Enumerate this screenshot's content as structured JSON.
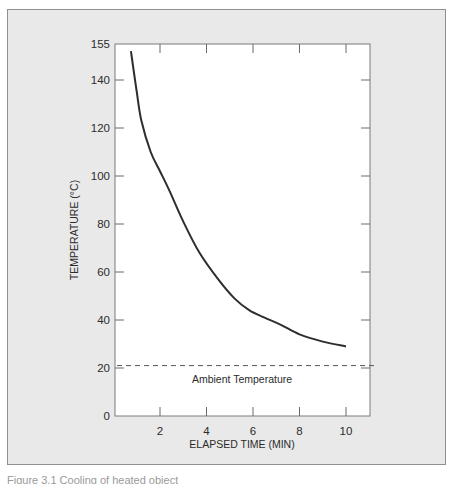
{
  "chart_data": {
    "type": "line",
    "title": "",
    "xlabel": "ELAPSED TIME (MIN)",
    "ylabel": "TEMPERATURE (°C)",
    "xlim": [
      0,
      11
    ],
    "ylim": [
      0,
      155
    ],
    "x_ticks": [
      2,
      4,
      6,
      8,
      10
    ],
    "x_tick_labels": [
      "2",
      "4",
      "6",
      "8",
      "10"
    ],
    "y_ticks": [
      0,
      20,
      40,
      60,
      80,
      100,
      120,
      140,
      155
    ],
    "y_tick_labels": [
      "0",
      "20",
      "40",
      "60",
      "80",
      "100",
      "120",
      "140",
      "155"
    ],
    "grid": false,
    "legend": null,
    "series": [
      {
        "name": "Cooling curve",
        "style": "solid",
        "color": "#2e2e2e",
        "x": [
          0.75,
          1.0,
          1.2,
          1.6,
          2.0,
          2.4,
          3.0,
          3.7,
          4.5,
          5.2,
          5.85,
          6.5,
          7.2,
          8.0,
          9.0,
          10.0
        ],
        "y": [
          152,
          135,
          123,
          110,
          102,
          94,
          81,
          68,
          57,
          49,
          44,
          41,
          38,
          34,
          31,
          29
        ]
      },
      {
        "name": "Ambient Temperature",
        "style": "dashed",
        "color": "#555555",
        "x": [
          0,
          11
        ],
        "y": [
          21,
          21
        ]
      }
    ],
    "annotations": [
      {
        "text": "Ambient Temperature",
        "x": 5.5,
        "y": 15
      }
    ]
  },
  "figure": {
    "caption": "Figure 3.1  Cooling of heated object"
  }
}
